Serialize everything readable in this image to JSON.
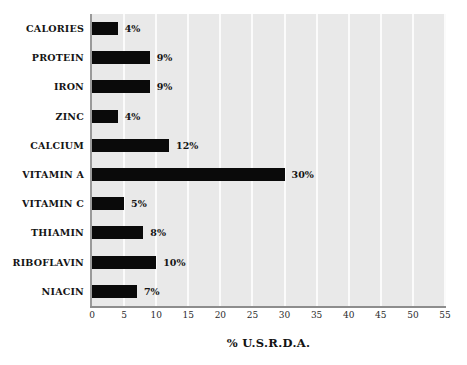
{
  "chart_data": {
    "type": "bar",
    "orientation": "horizontal",
    "title": "",
    "subtitle": "",
    "xlabel": "% U.S.R.D.A.",
    "ylabel": "",
    "xlim": [
      0,
      55
    ],
    "xticks": [
      0,
      5,
      10,
      15,
      20,
      25,
      30,
      35,
      40,
      45,
      50,
      55
    ],
    "xtick_labels": [
      "0",
      "5",
      "10",
      "15",
      "20",
      "25",
      "30",
      "35",
      "40",
      "45",
      "50",
      "55"
    ],
    "grid": "vertical-white-on-gray",
    "legend": null,
    "categories": [
      "CALORIES",
      "PROTEIN",
      "IRON",
      "ZINC",
      "CALCIUM",
      "VITAMIN A",
      "VITAMIN C",
      "THIAMIN",
      "RIBOFLAVIN",
      "NIACIN"
    ],
    "values": [
      4,
      9,
      9,
      4,
      12,
      30,
      5,
      8,
      10,
      7
    ],
    "data_labels": [
      "4%",
      "9%",
      "9%",
      "4%",
      "12%",
      "30%",
      "5%",
      "8%",
      "10%",
      "7%"
    ],
    "bars": [
      {
        "category": "CALORIES",
        "value": 4,
        "label": "4%"
      },
      {
        "category": "PROTEIN",
        "value": 9,
        "label": "9%"
      },
      {
        "category": "IRON",
        "value": 9,
        "label": "9%"
      },
      {
        "category": "ZINC",
        "value": 4,
        "label": "4%"
      },
      {
        "category": "CALCIUM",
        "value": 12,
        "label": "12%"
      },
      {
        "category": "VITAMIN A",
        "value": 30,
        "label": "30%"
      },
      {
        "category": "VITAMIN C",
        "value": 5,
        "label": "5%"
      },
      {
        "category": "THIAMIN",
        "value": 8,
        "label": "8%"
      },
      {
        "category": "RIBOFLAVIN",
        "value": 10,
        "label": "10%"
      },
      {
        "category": "NIACIN",
        "value": 7,
        "label": "7%"
      }
    ],
    "colors": {
      "bar": "#0a0a0a",
      "plot_background": "#e9e9e9",
      "gridline": "#fbfbfb",
      "axis_line": "#8d8d8d",
      "text": "#141414",
      "page_background": "#ffffff"
    }
  }
}
